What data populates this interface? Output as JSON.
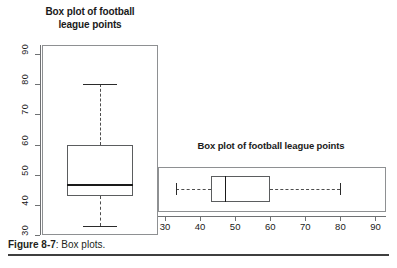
{
  "caption": {
    "label": "Figure 8-7",
    "text": ": Box plots."
  },
  "colors": {
    "panel_border": "#8e9092",
    "axis": "#6f7173",
    "box_border": "#5b5d5f",
    "median": "#1a1a1a",
    "whisker": "#4d4d4d",
    "background": "#ffffff",
    "text": "#231f20"
  },
  "chart_data": [
    {
      "type": "box",
      "orientation": "vertical",
      "title": "Box plot of football league points",
      "title_line1": "Box plot of football",
      "title_line2": "league points",
      "xlabel": "",
      "ylabel": "",
      "ylim": [
        30,
        93
      ],
      "axis_ticks": [
        30,
        40,
        50,
        60,
        70,
        80,
        90
      ],
      "tick_labels": [
        "30",
        "40",
        "50",
        "60",
        "70",
        "80",
        "90"
      ],
      "grid": false,
      "legend": false,
      "boxes": [
        {
          "name": "football league points",
          "min": 33,
          "q1": 43,
          "median": 47,
          "q3": 60,
          "max": 80,
          "outliers": []
        }
      ]
    },
    {
      "type": "box",
      "orientation": "horizontal",
      "title": "Box plot of football league points",
      "xlabel": "",
      "ylabel": "",
      "xlim": [
        28,
        93
      ],
      "axis_ticks": [
        30,
        40,
        50,
        60,
        70,
        80,
        90
      ],
      "tick_labels": [
        "30",
        "40",
        "50",
        "60",
        "70",
        "80",
        "90"
      ],
      "grid": false,
      "legend": false,
      "boxes": [
        {
          "name": "football league points",
          "min": 33,
          "q1": 43,
          "median": 47,
          "q3": 60,
          "max": 80,
          "outliers": []
        }
      ]
    }
  ]
}
